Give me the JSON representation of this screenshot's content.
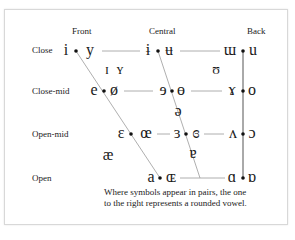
{
  "columns": {
    "front": "Front",
    "central": "Central",
    "back": "Back"
  },
  "rows": {
    "close": "Close",
    "close_mid": "Close-mid",
    "open_mid": "Open-mid",
    "open": "Open"
  },
  "vowels": {
    "close": {
      "front_unrounded": "i",
      "front_rounded": "y",
      "central_unrounded": "ɨ",
      "central_rounded": "ʉ",
      "back_unrounded": "ɯ",
      "back_rounded": "u"
    },
    "near_close": {
      "front_unrounded": "ɪ",
      "front_rounded": "ʏ",
      "back_rounded": "ʊ"
    },
    "close_mid": {
      "front_unrounded": "e",
      "front_rounded": "ø",
      "central_unrounded": "ɘ",
      "central_rounded": "ɵ",
      "back_unrounded": "ɤ",
      "back_rounded": "o"
    },
    "mid": {
      "central": "ə"
    },
    "open_mid": {
      "front_unrounded": "ɛ",
      "front_rounded": "œ",
      "central_unrounded": "ɜ",
      "central_rounded": "ɞ",
      "back_unrounded": "ʌ",
      "back_rounded": "ɔ"
    },
    "near_open": {
      "front": "æ",
      "central": "ɐ"
    },
    "open": {
      "front_unrounded": "a",
      "front_rounded": "ɶ",
      "back_unrounded": "ɑ",
      "back_rounded": "ɒ"
    }
  },
  "caption": {
    "line1": "Where symbols appear in pairs, the one",
    "line2": "to the right represents a rounded vowel."
  }
}
